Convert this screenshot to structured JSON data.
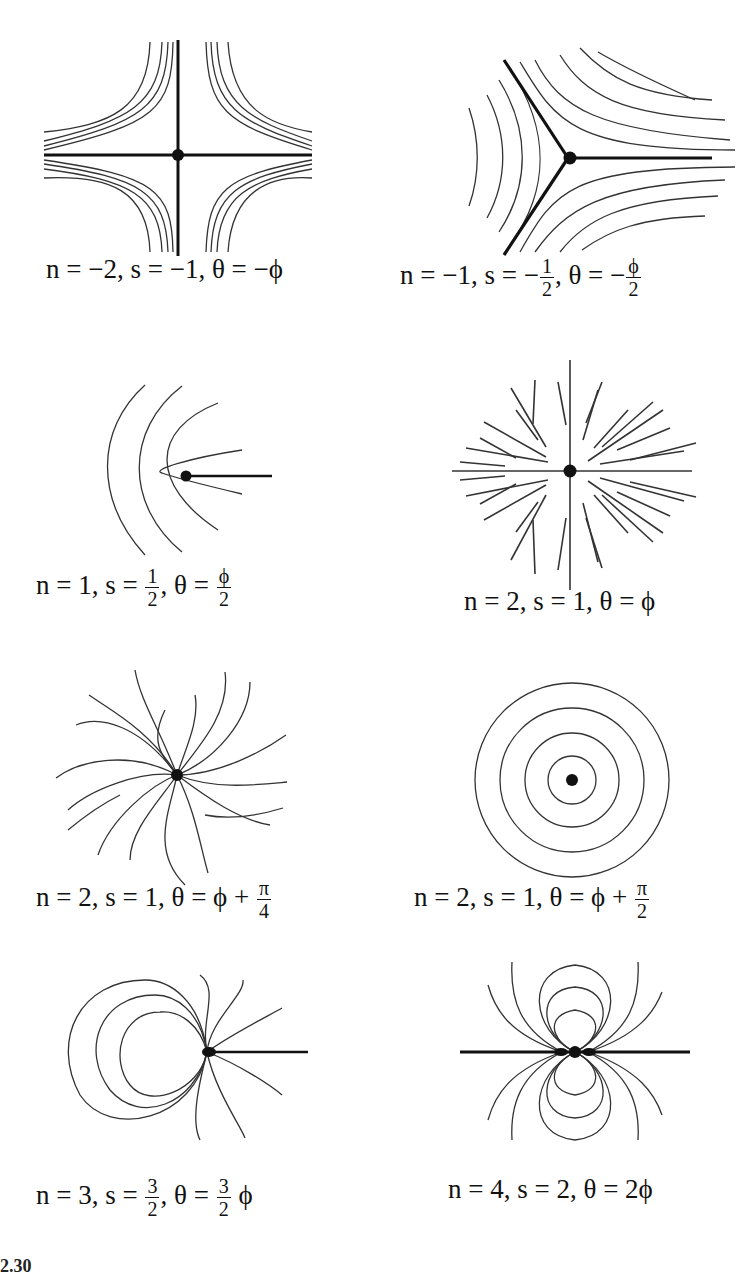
{
  "figure": {
    "panels": [
      {
        "id": "p1",
        "n": "−2",
        "s": "−1",
        "theta": "−ϕ",
        "caption_prefix": "n = −2, s = −1, θ = −ϕ"
      },
      {
        "id": "p2",
        "n": "−1",
        "s_sign": "−",
        "s_num": "1",
        "s_den": "2",
        "theta_sign": "−",
        "theta_num": "ϕ",
        "theta_den": "2",
        "caption_prefix": "n = −1, s = ",
        "caption_mid": ", θ = "
      },
      {
        "id": "p3",
        "caption_prefix": "n = 1, s = ",
        "s_num": "1",
        "s_den": "2",
        "caption_mid": ", θ = ",
        "theta_num": "ϕ",
        "theta_den": "2"
      },
      {
        "id": "p4",
        "caption": "n = 2, s = 1, θ = ϕ"
      },
      {
        "id": "p5",
        "caption_prefix": "n = 2, s = 1, θ = ϕ + ",
        "theta_num": "π",
        "theta_den": "4"
      },
      {
        "id": "p6",
        "caption_prefix": "n = 2, s = 1, θ = ϕ + ",
        "theta_num": "π",
        "theta_den": "2"
      },
      {
        "id": "p7",
        "caption_prefix": "n = 3, s = ",
        "s_num": "3",
        "s_den": "2",
        "caption_mid": ", θ = ",
        "theta_num": "3",
        "theta_den": "2",
        "caption_suffix": " ϕ"
      },
      {
        "id": "p8",
        "caption": "n = 4, s = 2, θ = 2ϕ"
      }
    ],
    "footer_fragment": "2.30"
  }
}
